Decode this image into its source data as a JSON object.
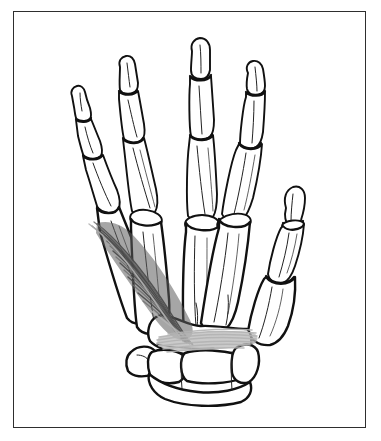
{
  "figure": {
    "view": "palmar view of right hand skeleton",
    "background_color": "#ffffff",
    "frame_color": "#2e2e2e",
    "outline_color": "#111111",
    "muscle_dark_color": "#4a4a4a",
    "muscle_mid_color": "#6e6e6e",
    "muscle_light_color": "#b2b2b2",
    "alt_text": "Line drawing of a hand skeleton showing phalanges, metacarpals and carpal bones, with the adductor pollicis muscle shaded in gray fibers running from the third metacarpal toward the thumb."
  },
  "frame": {
    "left": 13,
    "top": 11,
    "width": 353,
    "height": 417,
    "border_width": 1.4
  },
  "structures": {
    "digits": [
      {
        "name": "little-finger",
        "label": "Digit V (little finger)",
        "bones": [
          "distal phalanx",
          "middle phalanx",
          "proximal phalanx",
          "fifth metacarpal"
        ]
      },
      {
        "name": "ring-finger",
        "label": "Digit IV (ring finger)",
        "bones": [
          "distal phalanx",
          "middle phalanx",
          "proximal phalanx",
          "fourth metacarpal"
        ]
      },
      {
        "name": "middle-finger",
        "label": "Digit III (middle finger)",
        "bones": [
          "distal phalanx",
          "middle phalanx",
          "proximal phalanx",
          "third metacarpal"
        ]
      },
      {
        "name": "index-finger",
        "label": "Digit II (index finger)",
        "bones": [
          "distal phalanx",
          "middle phalanx",
          "proximal phalanx",
          "second metacarpal"
        ]
      },
      {
        "name": "thumb",
        "label": "Digit I (thumb)",
        "bones": [
          "distal phalanx",
          "proximal phalanx",
          "first metacarpal"
        ]
      }
    ],
    "carpus": {
      "name": "carpal-bones",
      "label": "Carpal bones",
      "bones": [
        "trapezium",
        "trapezoid",
        "capitate",
        "hamate",
        "scaphoid",
        "lunate",
        "triquetrum",
        "pisiform"
      ]
    },
    "muscle": {
      "name": "adductor-pollicis",
      "label": "Adductor pollicis",
      "heads": [
        "oblique head",
        "transverse head"
      ],
      "oblique_head_note": "dark gray striated fibers running diagonally",
      "transverse_head_note": "light gray horizontal fiber band"
    }
  }
}
